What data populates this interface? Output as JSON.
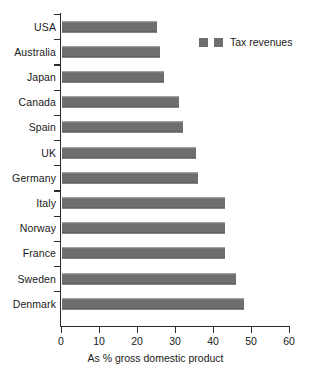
{
  "chart_data": {
    "type": "bar",
    "orientation": "horizontal",
    "title": "",
    "xlabel": "As % gross domestic product",
    "ylabel": "",
    "xlim": [
      0,
      60
    ],
    "xticks": [
      0,
      10,
      20,
      30,
      40,
      50,
      60
    ],
    "xtick_labels": [
      "0",
      "10",
      "20",
      "30",
      "40",
      "50",
      "60"
    ],
    "grid": false,
    "legend_position": "top-right",
    "bar_color": "#6e6e6e",
    "axis_color": "#2b2b2b",
    "categories": [
      "USA",
      "Australia",
      "Japan",
      "Canada",
      "Spain",
      "UK",
      "Germany",
      "Italy",
      "Norway",
      "France",
      "Sweden",
      "Denmark"
    ],
    "values": [
      25,
      26,
      27,
      31,
      32,
      35.5,
      36,
      43,
      43,
      43,
      46,
      48
    ],
    "series": [
      {
        "name": "Tax revenues",
        "values": [
          25,
          26,
          27,
          31,
          32,
          35.5,
          36,
          43,
          43,
          43,
          46,
          48
        ]
      }
    ]
  },
  "legend": {
    "entries": [
      {
        "label": "",
        "color": "#6e6e6e"
      },
      {
        "label": "Tax revenues",
        "color": "#6e6e6e"
      }
    ],
    "text": "Tax revenues"
  }
}
